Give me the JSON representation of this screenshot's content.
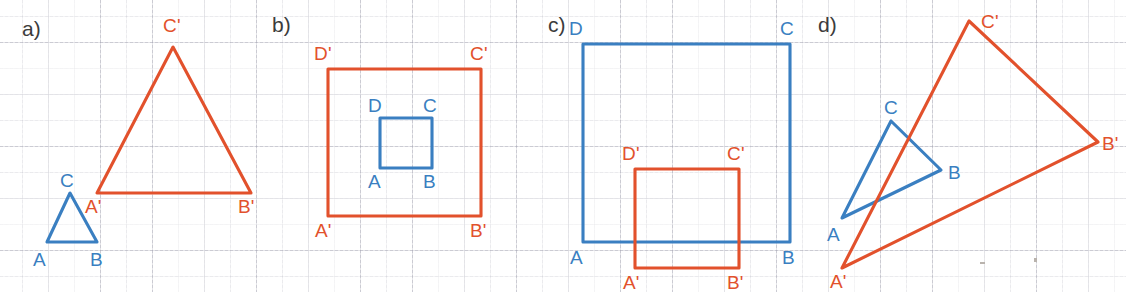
{
  "figure": {
    "width": 1126,
    "height": 292,
    "background": "#ffffff",
    "grid": {
      "visible": true,
      "major_spacing_px": 52,
      "minor_spacing_px": 26,
      "color": "#9a9aa5"
    },
    "colors": {
      "preimage_blue": "#3a7fc1",
      "image_red": "#e2512c",
      "panel_tag": "#3b3b3b"
    }
  },
  "panels": [
    {
      "tag": "a)",
      "tag_pos": {
        "x": 22,
        "y": 18
      },
      "preimage": {
        "name": "triangle-ABC",
        "color": "#3a7fc1",
        "points": "47,242 97,242 70,193",
        "vertices": [
          {
            "label": "A",
            "x": 47,
            "y": 242,
            "label_x": 33,
            "label_y": 250
          },
          {
            "label": "B",
            "x": 97,
            "y": 242,
            "label_x": 90,
            "label_y": 250
          },
          {
            "label": "C",
            "x": 70,
            "y": 193,
            "label_x": 60,
            "label_y": 171
          }
        ]
      },
      "image": {
        "name": "triangle-A-prime-B-prime-C-prime",
        "color": "#e2512c",
        "points": "97,193 251,193 173,47",
        "vertices": [
          {
            "label": "A'",
            "x": 97,
            "y": 193,
            "label_x": 85,
            "label_y": 197
          },
          {
            "label": "B'",
            "x": 251,
            "y": 193,
            "label_x": 238,
            "label_y": 197
          },
          {
            "label": "C'",
            "x": 173,
            "y": 47,
            "label_x": 163,
            "label_y": 16
          }
        ]
      }
    },
    {
      "tag": "b)",
      "tag_pos": {
        "x": 272,
        "y": 14
      },
      "preimage": {
        "name": "square-ABCD",
        "color": "#3a7fc1",
        "points": "380,168 432,168 432,118 380,118",
        "vertices": [
          {
            "label": "A",
            "x": 380,
            "y": 168,
            "label_x": 368,
            "label_y": 172
          },
          {
            "label": "B",
            "x": 432,
            "y": 168,
            "label_x": 423,
            "label_y": 172
          },
          {
            "label": "C",
            "x": 432,
            "y": 118,
            "label_x": 423,
            "label_y": 96
          },
          {
            "label": "D",
            "x": 380,
            "y": 118,
            "label_x": 368,
            "label_y": 96
          }
        ]
      },
      "image": {
        "name": "square-A-prime-B-prime-C-prime-D-prime",
        "color": "#e2512c",
        "points": "328,216 481,216 481,69 328,69",
        "vertices": [
          {
            "label": "A'",
            "x": 328,
            "y": 216,
            "label_x": 315,
            "label_y": 221
          },
          {
            "label": "B'",
            "x": 481,
            "y": 216,
            "label_x": 470,
            "label_y": 221
          },
          {
            "label": "C'",
            "x": 481,
            "y": 69,
            "label_x": 470,
            "label_y": 44
          },
          {
            "label": "D'",
            "x": 328,
            "y": 69,
            "label_x": 314,
            "label_y": 44
          }
        ]
      }
    },
    {
      "tag": "c)",
      "tag_pos": {
        "x": 548,
        "y": 14
      },
      "preimage": {
        "name": "square-ABCD",
        "color": "#3a7fc1",
        "points": "583,242 790,242 790,44 583,44",
        "vertices": [
          {
            "label": "A",
            "x": 583,
            "y": 242,
            "label_x": 570,
            "label_y": 248
          },
          {
            "label": "B",
            "x": 790,
            "y": 242,
            "label_x": 782,
            "label_y": 248
          },
          {
            "label": "C",
            "x": 790,
            "y": 44,
            "label_x": 780,
            "label_y": 19
          },
          {
            "label": "D",
            "x": 583,
            "y": 44,
            "label_x": 569,
            "label_y": 19
          }
        ]
      },
      "image": {
        "name": "square-A-prime-B-prime-C-prime-D-prime",
        "color": "#e2512c",
        "points": "635,268 739,268 739,169 635,169",
        "vertices": [
          {
            "label": "A'",
            "x": 635,
            "y": 268,
            "label_x": 623,
            "label_y": 273
          },
          {
            "label": "B'",
            "x": 739,
            "y": 268,
            "label_x": 727,
            "label_y": 273
          },
          {
            "label": "C'",
            "x": 739,
            "y": 169,
            "label_x": 727,
            "label_y": 144
          },
          {
            "label": "D'",
            "x": 635,
            "y": 169,
            "label_x": 622,
            "label_y": 144
          }
        ]
      }
    },
    {
      "tag": "d)",
      "tag_pos": {
        "x": 818,
        "y": 14
      },
      "preimage": {
        "name": "triangle-ABC",
        "color": "#3a7fc1",
        "points": "842,218 941,170 891,121",
        "vertices": [
          {
            "label": "A",
            "x": 842,
            "y": 218,
            "label_x": 827,
            "label_y": 225
          },
          {
            "label": "B",
            "x": 941,
            "y": 170,
            "label_x": 948,
            "label_y": 163
          },
          {
            "label": "C",
            "x": 891,
            "y": 121,
            "label_x": 884,
            "label_y": 98
          }
        ]
      },
      "image": {
        "name": "triangle-A-prime-B-prime-C-prime",
        "color": "#e2512c",
        "points": "842,268 1098,142 969,21",
        "vertices": [
          {
            "label": "A'",
            "x": 842,
            "y": 268,
            "label_x": 830,
            "label_y": 272
          },
          {
            "label": "B'",
            "x": 1098,
            "y": 142,
            "label_x": 1102,
            "label_y": 134
          },
          {
            "label": "C'",
            "x": 969,
            "y": 21,
            "label_x": 981,
            "label_y": 12
          }
        ]
      }
    }
  ],
  "specks": [
    {
      "x": 980,
      "y": 262,
      "w": 5,
      "h": 2
    },
    {
      "x": 1034,
      "y": 258,
      "w": 3,
      "h": 4
    }
  ]
}
